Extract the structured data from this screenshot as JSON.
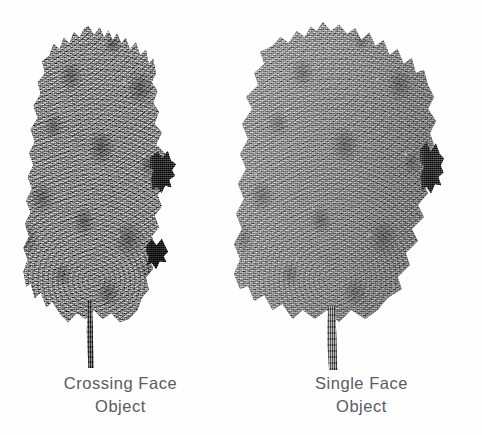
{
  "figure": {
    "background_color": "#fefefe",
    "caption_color": "#5a5a60",
    "panels": [
      {
        "id": "crossing",
        "caption_line1": "Crossing Face",
        "caption_line2": "Object",
        "tree": {
          "kind": "tree-illustration",
          "style": "grayscale scanned halftone",
          "canopy_shape": "narrow columnar, jagged spiky silhouette",
          "canopy_tone": "#3e3e3e",
          "canopy_tone_light": "#6d6d6d",
          "canopy_tone_dark": "#1f1f1f",
          "trunk_tone": "#3c3c3c",
          "relative_density": "dense / dark"
        }
      },
      {
        "id": "single",
        "caption_line1": "Single Face",
        "caption_line2": "Object",
        "tree": {
          "kind": "tree-illustration",
          "style": "grayscale scanned halftone",
          "canopy_shape": "broad rounded crown, lobed silhouette",
          "canopy_tone": "#8a8a8a",
          "canopy_tone_light": "#b8b8b8",
          "canopy_tone_dark": "#4a4a4a",
          "trunk_tone": "#5c5c5c",
          "relative_density": "sparse / light"
        }
      }
    ]
  }
}
